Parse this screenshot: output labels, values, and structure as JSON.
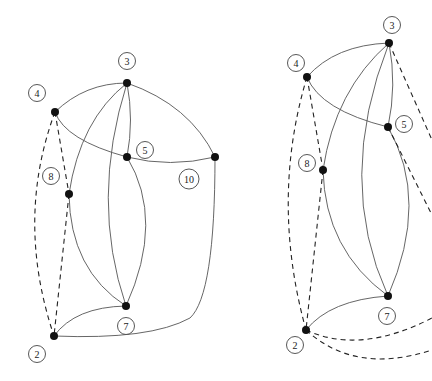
{
  "graphs": [
    {
      "name": "left-graph",
      "nodes": [
        {
          "id": "3",
          "x": 127,
          "y": 83
        },
        {
          "id": "4",
          "x": 55,
          "y": 112
        },
        {
          "id": "5",
          "x": 127,
          "y": 157
        },
        {
          "id": "10",
          "x": 215,
          "y": 157
        },
        {
          "id": "8",
          "x": 69,
          "y": 194
        },
        {
          "id": "7",
          "x": 126,
          "y": 306
        },
        {
          "id": "2",
          "x": 54,
          "y": 336
        }
      ],
      "labels": [
        {
          "text": "3",
          "x": 127,
          "y": 61
        },
        {
          "text": "4",
          "x": 37,
          "y": 93
        },
        {
          "text": "5",
          "x": 145,
          "y": 150
        },
        {
          "text": "8",
          "x": 51,
          "y": 176
        },
        {
          "text": "10",
          "x": 189,
          "y": 179
        },
        {
          "text": "7",
          "x": 126,
          "y": 326
        },
        {
          "text": "2",
          "x": 37,
          "y": 354
        }
      ]
    },
    {
      "name": "right-graph",
      "nodes": [
        {
          "id": "3",
          "x": 389,
          "y": 43
        },
        {
          "id": "4",
          "x": 307,
          "y": 77
        },
        {
          "id": "5",
          "x": 388,
          "y": 127
        },
        {
          "id": "8",
          "x": 323,
          "y": 170
        },
        {
          "id": "7",
          "x": 388,
          "y": 296
        },
        {
          "id": "2",
          "x": 306,
          "y": 330
        }
      ],
      "labels": [
        {
          "text": "3",
          "x": 392,
          "y": 25
        },
        {
          "text": "4",
          "x": 296,
          "y": 63
        },
        {
          "text": "5",
          "x": 404,
          "y": 124
        },
        {
          "text": "8",
          "x": 307,
          "y": 163
        },
        {
          "text": "7",
          "x": 387,
          "y": 316
        },
        {
          "text": "2",
          "x": 295,
          "y": 345
        }
      ]
    }
  ]
}
